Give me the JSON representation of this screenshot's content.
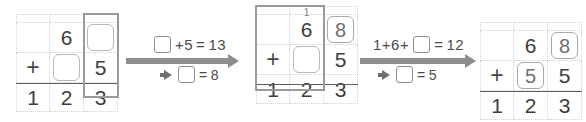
{
  "colors": {
    "digit": "#3d3d3d",
    "grid_line": "#d2d2d2",
    "rule": "#5d5d5d",
    "arrow": "#8d8d8d",
    "highlight_border": "#9a9a9a",
    "answer_box_border": "#b8b8b8",
    "carry_text": "#8a8a8a",
    "background": "#ffffff"
  },
  "steps": [
    {
      "name": "step-1",
      "grid": {
        "carry_row": [
          "",
          "",
          ""
        ],
        "row_addend_1": [
          "",
          "6",
          "__BOX_EMPTY__"
        ],
        "row_addend_2": [
          "+",
          "__BOX_EMPTY__",
          "5"
        ],
        "row_sum": [
          "1",
          "2",
          "3"
        ],
        "highlighted_column": "ones"
      }
    },
    {
      "name": "step-2",
      "grid": {
        "carry_row": [
          "",
          "1",
          ""
        ],
        "row_addend_1": [
          "",
          "6",
          "8"
        ],
        "row_addend_2": [
          "+",
          "__BOX_EMPTY__",
          "5"
        ],
        "row_sum": [
          "1",
          "2",
          "3"
        ],
        "highlighted_column": "tens"
      }
    },
    {
      "name": "step-3",
      "grid": {
        "carry_row": [
          "",
          "",
          ""
        ],
        "row_addend_1": [
          "",
          "6",
          "8"
        ],
        "row_addend_2": [
          "+",
          "5",
          "5"
        ],
        "row_sum": [
          "1",
          "2",
          "3"
        ],
        "highlighted_column": "none"
      }
    }
  ],
  "arrows": [
    {
      "name": "arrow-1",
      "equation_top": {
        "prefix": "",
        "after_box": "+5",
        "equals": "=",
        "result": "13"
      },
      "equation_bottom": {
        "after_box": "",
        "equals": "=",
        "result": "8"
      }
    },
    {
      "name": "arrow-2",
      "equation_top": {
        "prefix": "1+6+",
        "after_box": "",
        "equals": "=",
        "result": "12"
      },
      "equation_bottom": {
        "after_box": "",
        "equals": "=",
        "result": "5"
      }
    }
  ],
  "grid1": {
    "carry": {
      "c0": "",
      "c1": "",
      "c2": ""
    },
    "r1": {
      "c0": "",
      "c1": "6",
      "c2": ""
    },
    "r2": {
      "c0": "+",
      "c1": "",
      "c2": "5"
    },
    "r3": {
      "c0": "1",
      "c1": "2",
      "c2": "3"
    }
  },
  "grid2": {
    "carry": {
      "c0": "",
      "c1": "1",
      "c2": ""
    },
    "r1": {
      "c0": "",
      "c1": "6",
      "c2": "8"
    },
    "r2": {
      "c0": "+",
      "c1": "",
      "c2": "5"
    },
    "r3": {
      "c0": "1",
      "c1": "2",
      "c2": "3"
    }
  },
  "grid3": {
    "carry": {
      "c0": "",
      "c1": "",
      "c2": ""
    },
    "r1": {
      "c0": "",
      "c1": "6",
      "c2": "8"
    },
    "r2": {
      "c0": "+",
      "c1": "5",
      "c2": "5"
    },
    "r3": {
      "c0": "1",
      "c1": "2",
      "c2": "3"
    }
  },
  "arrow1": {
    "top_after": "+5",
    "top_equals": "=",
    "top_result": "13",
    "bottom_equals": "=",
    "bottom_result": "8"
  },
  "arrow2": {
    "top_before": "1+6+",
    "top_equals": "=",
    "top_result": "12",
    "bottom_equals": "=",
    "bottom_result": "5"
  }
}
